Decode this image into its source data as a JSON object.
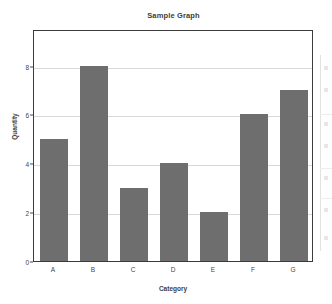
{
  "chart_data": {
    "type": "bar",
    "title": "Sample Graph",
    "xlabel": "Category",
    "ylabel": "Quantity",
    "categories": [
      "A",
      "B",
      "C",
      "D",
      "E",
      "F",
      "G"
    ],
    "values": [
      5,
      8,
      3,
      4,
      2,
      6,
      7
    ],
    "ylim": [
      0,
      9.5
    ],
    "xlim": [
      0,
      7
    ],
    "y_ticks": [
      0,
      2,
      4,
      6,
      8
    ],
    "y_tick_labels": [
      "0",
      "2",
      "4",
      "6",
      "8"
    ],
    "gridlines": [
      2,
      4,
      6,
      8
    ],
    "grid": true,
    "grid_axis": "y",
    "legend": false,
    "bar_color": "#6e6e6e",
    "grid_color": "#d8d8d8",
    "frame_color": "#3b3b3b",
    "background_color": "#ffffff",
    "bar_width_ratio": 0.68
  },
  "figure": {
    "title": "Sample Graph",
    "background": "#ffffff"
  },
  "axes": {
    "y_axis_title": "Quantity",
    "x_axis_title": "Category"
  }
}
